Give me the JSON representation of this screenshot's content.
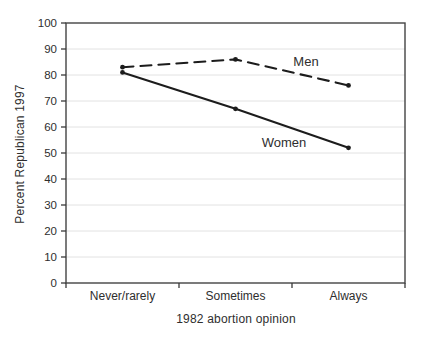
{
  "chart_data": {
    "type": "line",
    "title": "",
    "xlabel": "1982 abortion opinion",
    "ylabel": "Percent Republican 1997",
    "categories": [
      "Never/rarely",
      "Sometimes",
      "Always"
    ],
    "series": [
      {
        "name": "Men",
        "values": [
          83,
          86,
          76
        ],
        "style": "dashed"
      },
      {
        "name": "Women",
        "values": [
          81,
          67,
          52
        ],
        "style": "solid"
      }
    ],
    "ylim": [
      0,
      100
    ],
    "yticks": [
      0,
      10,
      20,
      30,
      40,
      50,
      60,
      70,
      80,
      90,
      100
    ],
    "grid": "horizontal",
    "legend_position": "inline"
  },
  "colors": {
    "line": "#1c1c1c",
    "grid": "#e2e2e2",
    "frame": "#444444",
    "tick": "#3a3a3a",
    "text": "#2e2e2e"
  }
}
